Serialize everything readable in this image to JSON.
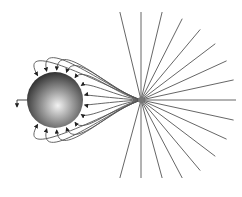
{
  "figure": {
    "sphere": {
      "cx": 55,
      "cy": 100,
      "r": 28,
      "label": ""
    },
    "point_charge": {
      "cx": 141,
      "cy": 100,
      "label": ""
    },
    "radial_line_count": 28,
    "curved_line_count": 14,
    "colors": {
      "line": "#555555",
      "sphere_light": "#e8e8e8",
      "sphere_dark": "#3a3a3a",
      "caption": "#c8c8c8"
    },
    "caption": ""
  }
}
